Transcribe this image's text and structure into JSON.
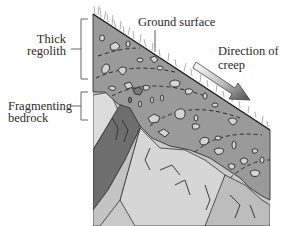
{
  "figure": {
    "type": "geology-diagram"
  },
  "labels": {
    "ground_surface": "Ground surface",
    "direction_line1": "Direction of",
    "direction_line2": "creep",
    "regolith_line1": "Thick",
    "regolith_line2": "regolith",
    "bedrock_line1": "Fragmenting",
    "bedrock_line2": "bedrock"
  },
  "colors": {
    "regolith": "#9a9a9a",
    "bedrock_dark": "#6e6e6e",
    "bedrock_light": "#d2d2d2",
    "bedrock_mid": "#bdbdbd",
    "clast": "#cfcfcf",
    "outline": "#333333",
    "arrow_start": "#ffffff",
    "arrow_end": "#5a5a5a"
  }
}
